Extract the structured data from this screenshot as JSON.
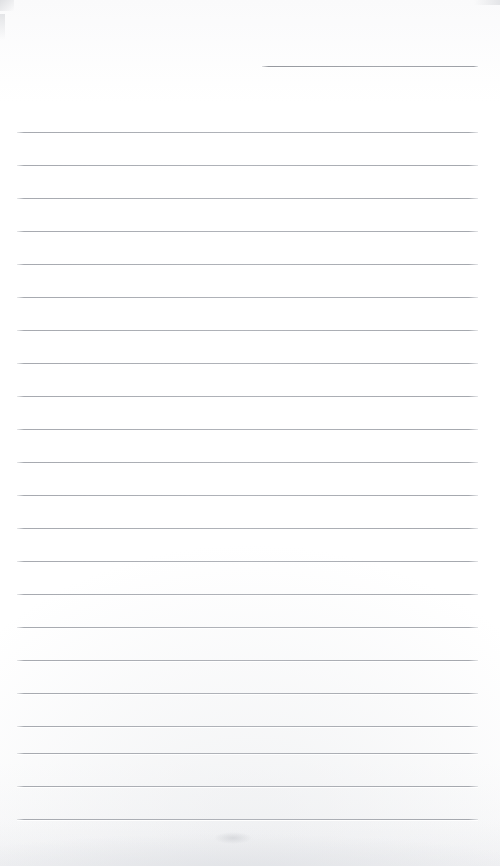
{
  "document": {
    "kind": "scanned-ruled-notebook-page",
    "title": "Blank ruled paper scan",
    "page_width": 500,
    "page_height": 866,
    "background_color": "#ffffff",
    "rule_color": "#b3b6bb",
    "text_content": "",
    "handwriting_present": "none",
    "visible_text_items": []
  },
  "ruling": {
    "line_spacing": 33,
    "first_full_line_y": 132,
    "last_full_line_y": 819,
    "full_line_left": 17,
    "full_line_right": 478,
    "full_line_count": 22,
    "short_line": {
      "label": "header-rule",
      "x_start": 262,
      "x_end": 478,
      "y": 66
    },
    "full_lines_y": [
      132,
      165,
      198,
      231,
      264,
      297,
      330,
      363,
      396,
      429,
      462,
      495,
      528,
      561,
      594,
      627,
      660,
      693,
      726,
      753,
      786,
      819
    ]
  },
  "artifacts": {
    "top_left_mark": "scan-edge-smudge",
    "top_right_mark": "scan-edge-smudge",
    "left_strip_mark": "scan-edge-smudge",
    "bottom_shadow": "page-edge-shadow",
    "bottom_speck": "faint-ink-speck"
  }
}
